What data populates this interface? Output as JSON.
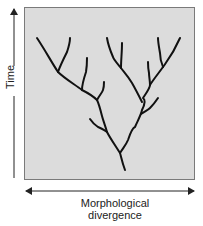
{
  "figure": {
    "y_axis_label": "Time",
    "x_axis_label_line1": "Morphological",
    "x_axis_label_line2": "divergence",
    "panel_fill": "#dcdcdc",
    "panel_border": "#7a7a7a",
    "branch_color": "#111111"
  }
}
